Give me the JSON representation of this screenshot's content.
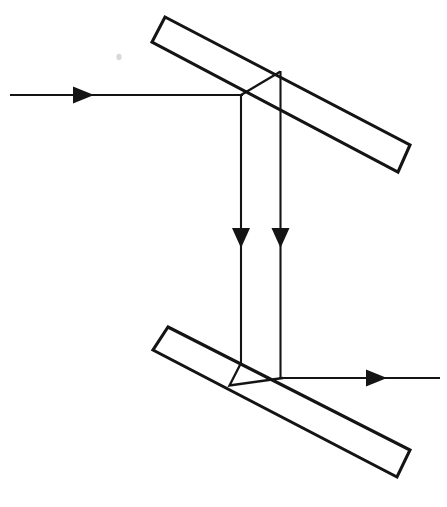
{
  "figure": {
    "background_color": "#ffffff",
    "ink_color": "#141414",
    "width": 447,
    "height": 507,
    "label_text": ""
  },
  "optics": {
    "components": [
      {
        "id": "upper-beam-splitter",
        "name": "upper-beam-splitter",
        "kind": "beam-splitter-slab",
        "orientation": "tilted-down-right",
        "angle_degrees": 31,
        "corners": [
          [
            165,
            17
          ],
          [
            410,
            145
          ],
          [
            398,
            172
          ],
          [
            152,
            42
          ]
        ],
        "reflective_face": [
          [
            152,
            42
          ],
          [
            398,
            172
          ]
        ],
        "interaction_point": [
          241,
          95
        ],
        "reflected_exit_point": [
          280,
          72
        ]
      },
      {
        "id": "lower-beam-splitter",
        "name": "lower-beam-splitter",
        "kind": "beam-splitter-slab",
        "orientation": "tilted-down-right",
        "angle_degrees": 31,
        "corners": [
          [
            168,
            327
          ],
          [
            410,
            450
          ],
          [
            397,
            477
          ],
          [
            153,
            350
          ]
        ],
        "reflective_face": [
          [
            153,
            350
          ],
          [
            397,
            477
          ]
        ],
        "interaction_point": [
          282,
          378
        ],
        "reflected_exit_point": [
          230,
          385
        ]
      }
    ],
    "rays": [
      {
        "id": "input-ray",
        "name": "input-ray-horizontal-left",
        "path": [
          [
            10,
            95
          ],
          [
            241,
            95
          ]
        ],
        "direction": "rightward",
        "arrowhead": {
          "x": 88,
          "y": 95,
          "heading": "right"
        }
      },
      {
        "id": "transmitted-ray-left",
        "name": "transmitted-ray-vertical-left",
        "path": [
          [
            241,
            95
          ],
          [
            241,
            363
          ]
        ],
        "direction": "downward",
        "arrowhead": {
          "x": 241,
          "y": 240,
          "heading": "down"
        }
      },
      {
        "id": "reflected-ray-right",
        "name": "reflected-ray-vertical-right",
        "path": [
          [
            280,
            72
          ],
          [
            280,
            378
          ]
        ],
        "direction": "downward",
        "arrowhead": {
          "x": 280,
          "y": 240,
          "heading": "down"
        }
      },
      {
        "id": "splitter-internal-upper",
        "name": "internal-reflection-segment-upper",
        "path": [
          [
            241,
            95
          ],
          [
            280,
            72
          ]
        ],
        "direction": "up-right"
      },
      {
        "id": "splitter-internal-lower",
        "name": "internal-reflection-segment-lower",
        "path": [
          [
            241,
            363
          ],
          [
            230,
            385
          ]
        ],
        "direction": "down-left"
      },
      {
        "id": "recombine-segment-lower",
        "name": "recombination-segment-lower",
        "path": [
          [
            230,
            385
          ],
          [
            282,
            378
          ]
        ],
        "direction": "right"
      },
      {
        "id": "output-ray",
        "name": "output-ray-horizontal-right",
        "path": [
          [
            282,
            378
          ],
          [
            440,
            378
          ]
        ],
        "direction": "rightward",
        "arrowhead": {
          "x": 381,
          "y": 378,
          "heading": "right"
        }
      }
    ],
    "arrow_count": 4,
    "splitter_count": 2
  }
}
